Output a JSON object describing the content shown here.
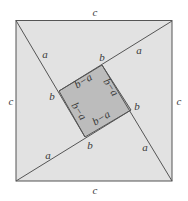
{
  "diagram": {
    "title": "",
    "colors": {
      "background": "#ffffff",
      "outer_fill": "#e2e2e2",
      "inner_fill": "#bcbcbc",
      "stroke": "#555555",
      "text": "#3a3a3a"
    },
    "outer_square": {
      "points": [
        [
          16,
          20
        ],
        [
          172,
          21
        ],
        [
          172,
          181
        ],
        [
          16,
          181
        ]
      ]
    },
    "inner_square": {
      "points": [
        [
          102,
          65
        ],
        [
          131,
          110
        ],
        [
          85,
          137
        ],
        [
          59,
          91
        ]
      ]
    },
    "lines": [
      {
        "from": [
          16,
          20
        ],
        "to": [
          131,
          110
        ]
      },
      {
        "from": [
          172,
          21
        ],
        "to": [
          59,
          91
        ]
      },
      {
        "from": [
          172,
          181
        ],
        "to": [
          59,
          91
        ]
      },
      {
        "from": [
          16,
          181
        ],
        "to": [
          131,
          110
        ]
      }
    ],
    "labels": {
      "c_top": "c",
      "c_bottom": "c",
      "c_left": "c",
      "c_right": "c",
      "a_upper_left": "a",
      "a_upper_right": "a",
      "a_lower_left": "a",
      "a_lower_right": "a",
      "b_top": "b",
      "b_left": "b",
      "b_right": "b",
      "b_bottom": "b",
      "ba_top": "b−a",
      "ba_right": "b−a",
      "ba_left": "b−a",
      "ba_bottom": "b−a"
    }
  }
}
